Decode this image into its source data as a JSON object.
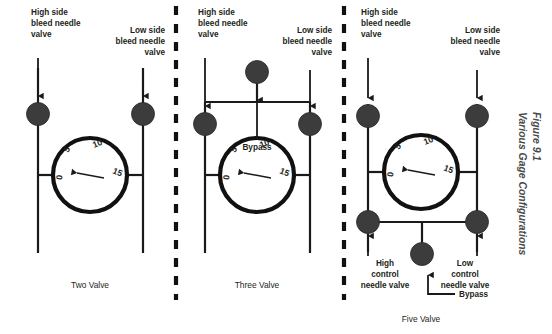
{
  "figure": {
    "caption_line1": "Figure 9.1",
    "caption_line2": "Various Gage Configurations",
    "background_color": "#ffffff",
    "line_color": "#1a1a1a",
    "valve_color": "#3c3c3c"
  },
  "gage": {
    "dial_numbers": [
      "0",
      "5",
      "10",
      "15"
    ],
    "needle_reading": "0"
  },
  "panels": [
    {
      "id": "two-valve",
      "caption": "Two Valve",
      "labels": {
        "high_side": "High side\nbleed needle\nvalve",
        "high_side_lines": [
          "High side",
          "bleed needle",
          "valve"
        ],
        "low_side_lines": [
          "Low side",
          "bleed needle",
          "valve"
        ]
      },
      "valve_count": 2,
      "valves": [
        "high side bleed needle valve",
        "low side bleed needle valve"
      ]
    },
    {
      "id": "three-valve",
      "caption": "Three Valve",
      "labels": {
        "high_side_lines": [
          "High side",
          "bleed needle",
          "valve"
        ],
        "low_side_lines": [
          "Low side",
          "bleed needle",
          "valve"
        ],
        "bypass": "Bypass"
      },
      "valve_count": 3,
      "valves": [
        "high side bleed needle valve",
        "low side bleed needle valve",
        "bypass valve"
      ]
    },
    {
      "id": "five-valve",
      "caption": "Five Valve",
      "labels": {
        "high_side_lines": [
          "High side",
          "bleed needle",
          "valve"
        ],
        "low_side_lines": [
          "Low side",
          "bleed needle",
          "valve"
        ],
        "high_control_lines": [
          "High",
          "control",
          "needle valve"
        ],
        "low_control_lines": [
          "Low",
          "control",
          "needle valve"
        ],
        "bypass": "Bypass"
      },
      "valve_count": 5,
      "valves": [
        "high side bleed needle valve",
        "low side bleed needle valve",
        "high control needle valve",
        "low control needle valve",
        "bypass valve"
      ]
    }
  ]
}
